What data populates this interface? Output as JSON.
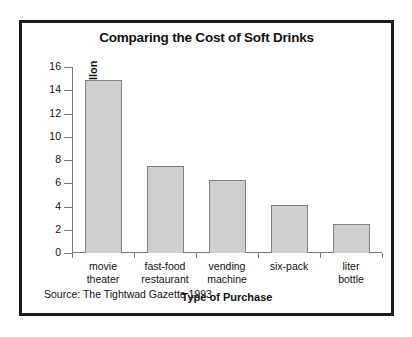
{
  "chart_data": {
    "type": "bar",
    "title": "Comparing the Cost of Soft Drinks",
    "xlabel": "Type of Purchase",
    "ylabel": "Dollars per gallon",
    "categories": [
      "movie\ntheater",
      "fast-food\nrestaurant",
      "vending\nmachine",
      "six-pack",
      "liter\nbottle"
    ],
    "values": [
      14.9,
      7.5,
      6.3,
      4.15,
      2.5
    ],
    "ylim": [
      0,
      16
    ],
    "yticks": [
      0,
      2,
      4,
      6,
      8,
      10,
      12,
      14,
      16
    ],
    "ytick_labels": [
      "0",
      "2",
      "4",
      "6",
      "8",
      "10",
      "12",
      "14",
      "16"
    ],
    "grid": false,
    "legend": "none",
    "bar_color": "#cfcfcf",
    "bar_edge_color": "#808080",
    "axis_color": "#777777",
    "text_color": "#111111",
    "frame_color": "#1a1a1a"
  },
  "source": {
    "note": "Source: The Tightwad Gazette 1993"
  }
}
